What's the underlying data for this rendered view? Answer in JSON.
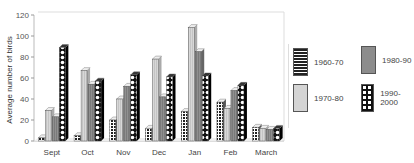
{
  "chart_data": {
    "type": "bar",
    "title": "",
    "xlabel": "",
    "ylabel": "Average number of birds",
    "ylim": [
      0,
      120
    ],
    "yticks": [
      0,
      20,
      40,
      60,
      80,
      100,
      120
    ],
    "grid": false,
    "legend_position": "right",
    "categories": [
      "Sept",
      "Oct",
      "Nov",
      "Dec",
      "Jan",
      "Feb",
      "March"
    ],
    "series": [
      {
        "name": "1960-70",
        "values": [
          3,
          5,
          20,
          12,
          28,
          37,
          13
        ]
      },
      {
        "name": "1970-80",
        "values": [
          29,
          67,
          40,
          78,
          108,
          31,
          12
        ]
      },
      {
        "name": "1980-90",
        "values": [
          23,
          54,
          52,
          42,
          85,
          48,
          11
        ]
      },
      {
        "name": "1990-2000",
        "values": [
          89,
          57,
          63,
          61,
          62,
          53,
          12
        ]
      }
    ]
  },
  "legend": {
    "items": [
      {
        "label": "1960-70",
        "pattern": "grid"
      },
      {
        "label": "1980-90",
        "pattern": "dark-gray"
      },
      {
        "label": "1970-80",
        "pattern": "light-gray"
      },
      {
        "label": "1990-2000",
        "pattern": "dots"
      }
    ]
  },
  "colors": {
    "grid_pattern": "#222222",
    "light_gray": "#d4d4d4",
    "dark_gray": "#8c8c8c",
    "dots_bg": "#111111"
  }
}
